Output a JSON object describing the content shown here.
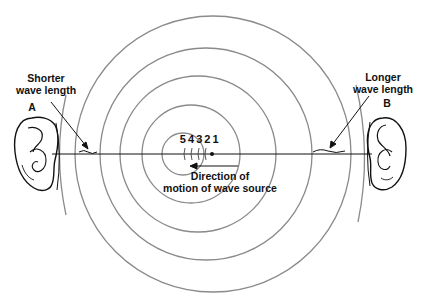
{
  "diagram": {
    "type": "doppler-effect",
    "labels": {
      "shorter_line1": "Shorter",
      "shorter_line2": "wave length",
      "longer_line1": "Longer",
      "longer_line2": "wave length",
      "ear_a": "A",
      "ear_b": "B",
      "source_positions": "5 4 3 2 1",
      "direction_line1": "Direction of",
      "direction_line2": "motion of wave source"
    },
    "colors": {
      "wavefront": "#8a8a8a",
      "ink": "#111111",
      "background": "#ffffff"
    },
    "axis_y": 154,
    "wavefronts": [
      {
        "cx": 183,
        "cy": 154,
        "r": 21
      },
      {
        "cx": 191,
        "cy": 154,
        "r": 49
      },
      {
        "cx": 198,
        "cy": 154,
        "r": 78
      },
      {
        "cx": 206,
        "cy": 154,
        "r": 106
      },
      {
        "cx": 213,
        "cy": 154,
        "r": 138
      }
    ],
    "source_dot": {
      "x": 212,
      "y": 154
    }
  }
}
